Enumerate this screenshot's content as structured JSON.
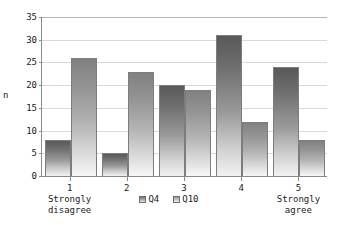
{
  "chart_data": {
    "type": "bar",
    "title": "",
    "xlabel": "",
    "ylabel": "n",
    "ylim": [
      0,
      35
    ],
    "ytick_step": 5,
    "yticks": [
      0,
      5,
      10,
      15,
      20,
      25,
      30,
      35
    ],
    "grid": true,
    "legend_position": "bottom-center",
    "categories": [
      "1",
      "2",
      "3",
      "4",
      "5"
    ],
    "category_descriptions": [
      "Strongly\ndisagree",
      "",
      "",
      "",
      "Strongly\nagree"
    ],
    "series": [
      {
        "name": "Q4",
        "values": [
          8,
          5,
          20,
          31,
          24
        ],
        "color": "#6e6e6e"
      },
      {
        "name": "Q10",
        "values": [
          26,
          23,
          19,
          12,
          8
        ],
        "color": "#a8a8a8"
      }
    ]
  },
  "axis": {
    "y_title": "n",
    "y_tick_labels": [
      "0",
      "5",
      "10",
      "15",
      "20",
      "25",
      "30",
      "35"
    ]
  },
  "legend": {
    "items": [
      {
        "label": "Q4",
        "swatch": "legend-swatch-q4"
      },
      {
        "label": "Q10",
        "swatch": "legend-swatch-q10"
      }
    ]
  }
}
